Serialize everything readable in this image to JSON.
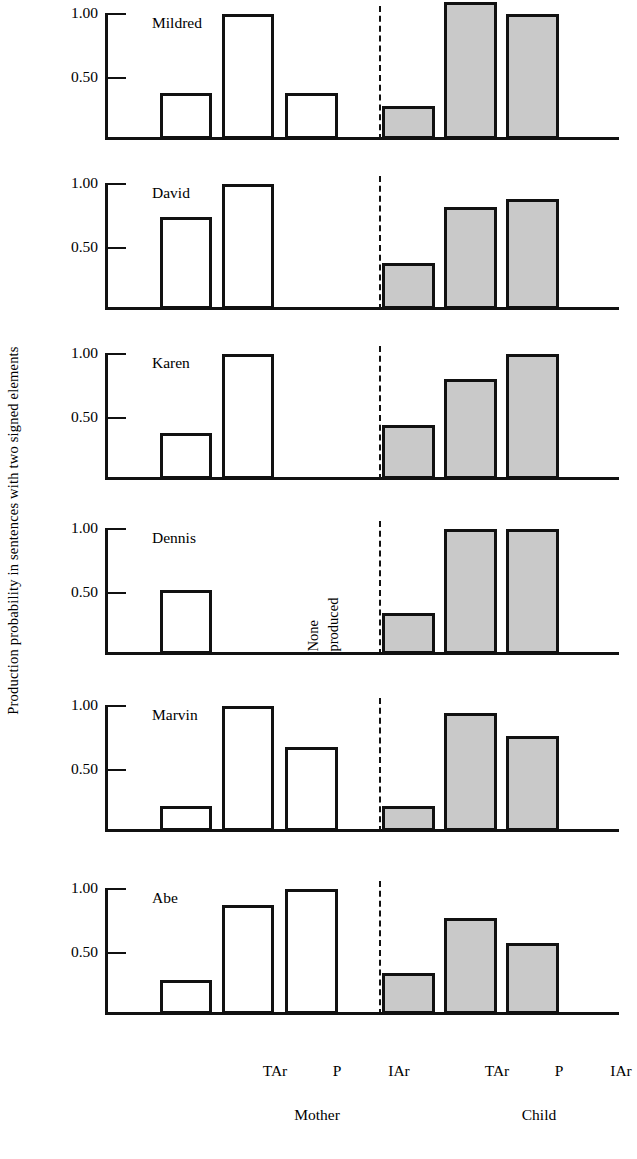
{
  "chart_data": {
    "type": "bar",
    "title": "",
    "ylabel": "Production probability in sentences with two signed elements",
    "xlabel": "",
    "ylim": [
      0,
      1.12
    ],
    "ytick_values": [
      1.0,
      0.5
    ],
    "ytick_labels": [
      "1.00",
      "0.50"
    ],
    "grid": false,
    "legend": null,
    "categories": [
      "TAr",
      "P",
      "IAr"
    ],
    "groups": [
      {
        "name": "Mother",
        "fill": "#ffffff"
      },
      {
        "name": "Child",
        "fill": "#c9c9c9"
      }
    ],
    "panels": [
      {
        "label": "Mildred",
        "mother": [
          0.37,
          1.0,
          0.37
        ],
        "child": [
          0.26,
          1.1,
          1.0
        ],
        "annotation": null
      },
      {
        "label": "David",
        "mother": [
          0.74,
          1.0,
          null
        ],
        "child": [
          0.37,
          0.82,
          0.88
        ],
        "annotation": null
      },
      {
        "label": "Karen",
        "mother": [
          0.37,
          1.0,
          null
        ],
        "child": [
          0.43,
          0.8,
          1.0
        ],
        "annotation": null
      },
      {
        "label": "Dennis",
        "mother": [
          0.51,
          null,
          null
        ],
        "child": [
          0.33,
          1.0,
          1.0
        ],
        "annotation": {
          "line1": "None",
          "line2": "produced"
        }
      },
      {
        "label": "Marvin",
        "mother": [
          0.2,
          1.0,
          0.67
        ],
        "child": [
          0.2,
          0.95,
          0.76
        ],
        "annotation": null
      },
      {
        "label": "Abe",
        "mother": [
          0.27,
          0.87,
          1.0
        ],
        "child": [
          0.33,
          0.77,
          0.57
        ],
        "annotation": null
      }
    ],
    "axis_colors": {
      "line": "#111111",
      "mother_bar_fill": "#ffffff",
      "child_bar_fill": "#c9c9c9",
      "bar_outline": "#111111"
    }
  },
  "axis": {
    "ytitle": "Production probability in sentences with two signed elements",
    "ytick_1": "1.00",
    "ytick_2": "0.50"
  },
  "xaxis": {
    "mother_tar": "TAr",
    "mother_p": "P",
    "mother_iar": "IAr",
    "child_tar": "TAr",
    "child_p": "P",
    "child_iar": "IAr"
  },
  "groups": {
    "mother": "Mother",
    "child": "Child"
  },
  "panel_labels": {
    "mildred": "Mildred",
    "david": "David",
    "karen": "Karen",
    "dennis": "Dennis",
    "marvin": "Marvin",
    "abe": "Abe"
  },
  "annotations": {
    "none_line1": "None",
    "none_line2": "produced"
  }
}
